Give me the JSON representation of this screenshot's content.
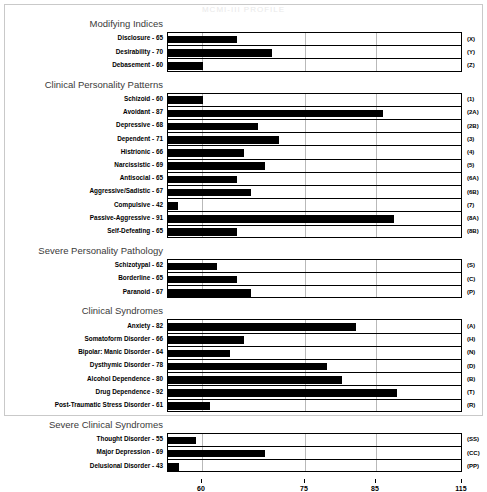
{
  "title": "MCMI-III PROFILE",
  "chart_data": {
    "type": "bar",
    "orientation": "horizontal",
    "title": "MCMI-III PROFILE",
    "xlabel": "",
    "ylabel": "",
    "xticks": [
      60,
      75,
      85,
      115
    ],
    "xtick_labels": [
      "60",
      "75",
      "85",
      "115"
    ],
    "xlim": [
      35,
      115
    ],
    "grid": true,
    "legend": "none",
    "axis_scale": "non-linear",
    "sections": [
      {
        "name": "Modifying Indices",
        "items": [
          {
            "label": "Disclosure - 65",
            "name": "Disclosure",
            "value": 65,
            "code": "(X)"
          },
          {
            "label": "Desirability - 70",
            "name": "Desirability",
            "value": 70,
            "code": "(Y)"
          },
          {
            "label": "Debasement - 60",
            "name": "Debasement",
            "value": 60,
            "code": "(Z)"
          }
        ]
      },
      {
        "name": "Clinical Personality Patterns",
        "items": [
          {
            "label": "Schizoid - 60",
            "name": "Schizoid",
            "value": 60,
            "code": "(1)"
          },
          {
            "label": "Avoidant - 87",
            "name": "Avoidant",
            "value": 87,
            "code": "(2A)"
          },
          {
            "label": "Depressive - 68",
            "name": "Depressive",
            "value": 68,
            "code": "(2B)"
          },
          {
            "label": "Dependent - 71",
            "name": "Dependent",
            "value": 71,
            "code": "(3)"
          },
          {
            "label": "Histrionic - 66",
            "name": "Histrionic",
            "value": 66,
            "code": "(4)"
          },
          {
            "label": "Narcissistic - 69",
            "name": "Narcissistic",
            "value": 69,
            "code": "(5)"
          },
          {
            "label": "Antisocial - 65",
            "name": "Antisocial",
            "value": 65,
            "code": "(6A)"
          },
          {
            "label": "Aggressive/Sadistic - 67",
            "name": "Aggressive/Sadistic",
            "value": 67,
            "code": "(6B)"
          },
          {
            "label": "Compulsive - 42",
            "name": "Compulsive",
            "value": 42,
            "code": "(7)"
          },
          {
            "label": "Passive-Aggressive - 91",
            "name": "Passive-Aggressive",
            "value": 91,
            "code": "(8A)"
          },
          {
            "label": "Self-Defeating - 65",
            "name": "Self-Defeating",
            "value": 65,
            "code": "(8B)"
          }
        ]
      },
      {
        "name": "Severe Personality Pathology",
        "items": [
          {
            "label": "Schizotypal - 62",
            "name": "Schizotypal",
            "value": 62,
            "code": "(S)"
          },
          {
            "label": "Borderline - 65",
            "name": "Borderline",
            "value": 65,
            "code": "(C)"
          },
          {
            "label": "Paranoid - 67",
            "name": "Paranoid",
            "value": 67,
            "code": "(P)"
          }
        ]
      },
      {
        "name": "Clinical Syndromes",
        "items": [
          {
            "label": "Anxiety - 82",
            "name": "Anxiety",
            "value": 82,
            "code": "(A)"
          },
          {
            "label": "Somatoform Disorder - 66",
            "name": "Somatoform Disorder",
            "value": 66,
            "code": "(H)"
          },
          {
            "label": "Bipolar: Manic Disorder - 64",
            "name": "Bipolar: Manic Disorder",
            "value": 64,
            "code": "(N)"
          },
          {
            "label": "Dysthymic Disorder - 78",
            "name": "Dysthymic Disorder",
            "value": 78,
            "code": "(D)"
          },
          {
            "label": "Alcohol Dependence - 80",
            "name": "Alcohol Dependence",
            "value": 80,
            "code": "(B)"
          },
          {
            "label": "Drug Dependence - 92",
            "name": "Drug Dependence",
            "value": 92,
            "code": "(T)"
          },
          {
            "label": "Post-Traumatic Stress Disorder - 61",
            "name": "Post-Traumatic Stress Disorder",
            "value": 61,
            "code": "(R)"
          }
        ]
      },
      {
        "name": "Severe Clinical Syndromes",
        "items": [
          {
            "label": "Thought Disorder - 55",
            "name": "Thought Disorder",
            "value": 55,
            "code": "(SS)"
          },
          {
            "label": "Major Depression - 69",
            "name": "Major Depression",
            "value": 69,
            "code": "(CC)"
          },
          {
            "label": "Delusional Disorder - 43",
            "name": "Delusional Disorder",
            "value": 43,
            "code": "(PP)"
          }
        ]
      }
    ]
  }
}
